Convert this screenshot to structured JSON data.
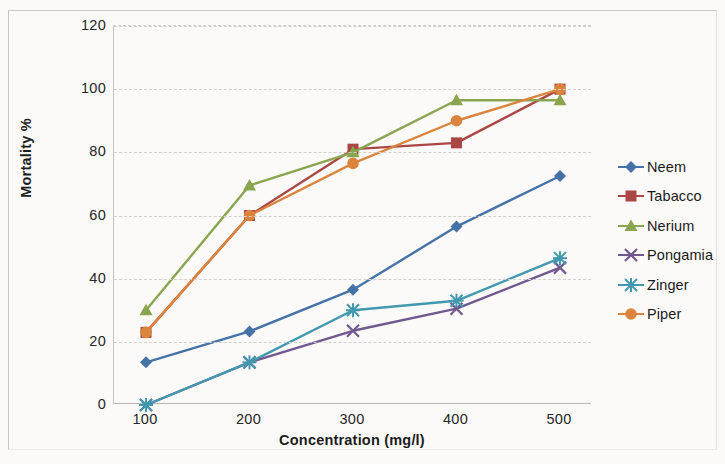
{
  "chart_data": {
    "type": "line",
    "title": "",
    "xlabel": "Concentration (mg/l)",
    "ylabel": "Mortality %",
    "categories": [
      "100",
      "200",
      "300",
      "400",
      "500"
    ],
    "x_values": [
      100,
      200,
      300,
      400,
      500
    ],
    "ylim": [
      0,
      120
    ],
    "ytick_labels": [
      "0",
      "20",
      "40",
      "60",
      "80",
      "100",
      "120"
    ],
    "ytick_values": [
      0,
      20,
      40,
      60,
      80,
      100,
      120
    ],
    "grid": true,
    "legend_position": "right",
    "series": [
      {
        "name": "Neem",
        "color": "#4573a7",
        "marker": "diamond",
        "values": [
          13.5,
          23.3,
          36.5,
          56.5,
          72.5
        ]
      },
      {
        "name": "Tabacco",
        "color": "#aa4644",
        "marker": "square",
        "values": [
          23.0,
          60.0,
          81.0,
          83.0,
          100.0
        ]
      },
      {
        "name": "Nerium",
        "color": "#89a54e",
        "marker": "triangle",
        "values": [
          30.0,
          69.5,
          80.0,
          96.5,
          96.5
        ]
      },
      {
        "name": "Pongamia",
        "color": "#71588f",
        "marker": "cross",
        "values": [
          0.0,
          13.5,
          23.5,
          30.5,
          43.5
        ]
      },
      {
        "name": "Zinger",
        "color": "#4198af",
        "marker": "asterisk",
        "values": [
          0.0,
          13.5,
          30.0,
          33.0,
          46.5
        ]
      },
      {
        "name": "Piper",
        "color": "#db843d",
        "marker": "circle",
        "values": [
          23.0,
          60.0,
          76.5,
          90.0,
          100.0
        ]
      }
    ]
  }
}
